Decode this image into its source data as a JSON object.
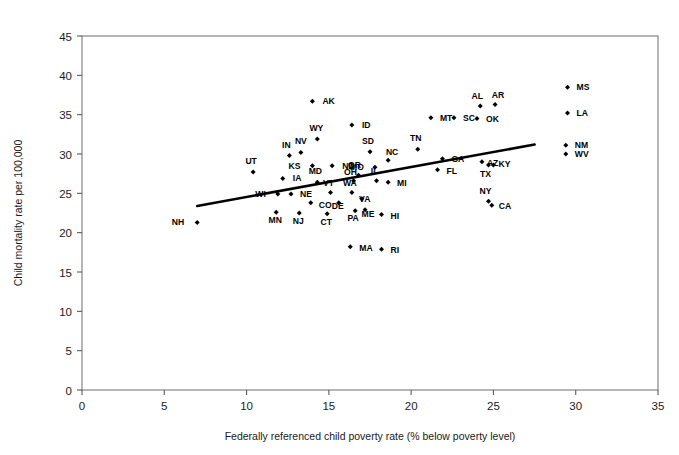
{
  "chart_data": {
    "type": "scatter",
    "title": "",
    "xlabel": "Federally referenced child poverty rate (% below poverty level)",
    "ylabel": "Child mortality rate per 100,000",
    "xlim": [
      0,
      35
    ],
    "ylim": [
      0,
      45
    ],
    "xticks": [
      0,
      5,
      10,
      15,
      20,
      25,
      30,
      35
    ],
    "yticks": [
      0,
      5,
      10,
      15,
      20,
      25,
      30,
      35,
      40,
      45
    ],
    "grid": false,
    "legend": null,
    "marker": "filled-diamond",
    "marker_color": "#000000",
    "trendline": {
      "type": "linear-fit",
      "color": "#000000",
      "x_start": 7.0,
      "y_start": 23.4,
      "x_end": 27.5,
      "y_end": 31.2
    },
    "point_label_field": "state",
    "points": [
      {
        "state": "NH",
        "x": 7.0,
        "y": 21.3,
        "lx": -13,
        "ly": 3
      },
      {
        "state": "UT",
        "x": 10.4,
        "y": 27.7,
        "lx": -2,
        "ly": -8
      },
      {
        "state": "MN",
        "x": 11.8,
        "y": 22.6,
        "lx": -1,
        "ly": 11
      },
      {
        "state": "IN",
        "x": 12.6,
        "y": 29.8,
        "lx": -3,
        "ly": -8
      },
      {
        "state": "NV",
        "x": 13.3,
        "y": 30.2,
        "lx": 0,
        "ly": -8
      },
      {
        "state": "IA",
        "x": 12.2,
        "y": 26.9,
        "lx": 10,
        "ly": 3
      },
      {
        "state": "WI",
        "x": 11.9,
        "y": 24.9,
        "lx": -12,
        "ly": 3
      },
      {
        "state": "NE",
        "x": 12.7,
        "y": 24.9,
        "lx": 9,
        "ly": 3
      },
      {
        "state": "KS",
        "x": 14.0,
        "y": 28.5,
        "lx": -12,
        "ly": 3
      },
      {
        "state": "ND",
        "x": 15.2,
        "y": 28.5,
        "lx": 10,
        "ly": 3
      },
      {
        "state": "WY",
        "x": 14.3,
        "y": 31.9,
        "lx": -1,
        "ly": -8
      },
      {
        "state": "AK",
        "x": 14.0,
        "y": 36.7,
        "lx": 10,
        "ly": 3
      },
      {
        "state": "ID",
        "x": 16.4,
        "y": 33.7,
        "lx": 10,
        "ly": 3
      },
      {
        "state": "MD",
        "x": 14.3,
        "y": 26.4,
        "lx": -2,
        "ly": -8
      },
      {
        "state": "CO",
        "x": 13.9,
        "y": 23.8,
        "lx": 8,
        "ly": 5
      },
      {
        "state": "NJ",
        "x": 13.2,
        "y": 22.5,
        "lx": -1,
        "ly": 11
      },
      {
        "state": "VT",
        "x": 15.1,
        "y": 25.1,
        "lx": -2,
        "ly": -7
      },
      {
        "state": "CT",
        "x": 14.9,
        "y": 22.4,
        "lx": -1,
        "ly": 11
      },
      {
        "state": "DE",
        "x": 15.6,
        "y": 23.8,
        "lx": -1,
        "ly": 6
      },
      {
        "state": "WA",
        "x": 16.4,
        "y": 25.1,
        "lx": -2,
        "ly": -7
      },
      {
        "state": "OH",
        "x": 16.5,
        "y": 26.6,
        "lx": -3,
        "ly": -6
      },
      {
        "state": "OR",
        "x": 16.8,
        "y": 27.3,
        "lx": -4,
        "ly": -7
      },
      {
        "state": "VA",
        "x": 17.0,
        "y": 24.3,
        "lx": 3,
        "ly": 3
      },
      {
        "state": "PA",
        "x": 16.6,
        "y": 22.8,
        "lx": -2,
        "ly": 10
      },
      {
        "state": "ME",
        "x": 17.2,
        "y": 22.9,
        "lx": 3,
        "ly": 7
      },
      {
        "state": "MA",
        "x": 16.3,
        "y": 18.2,
        "lx": 9,
        "ly": 4
      },
      {
        "state": "HI",
        "x": 18.2,
        "y": 22.3,
        "lx": 9,
        "ly": 4
      },
      {
        "state": "RI",
        "x": 18.2,
        "y": 17.9,
        "lx": 9,
        "ly": 4
      },
      {
        "state": "IL",
        "x": 17.9,
        "y": 26.6,
        "lx": -2,
        "ly": -7
      },
      {
        "state": "MI",
        "x": 18.6,
        "y": 26.4,
        "lx": 9,
        "ly": 4
      },
      {
        "state": "SD",
        "x": 17.5,
        "y": 30.3,
        "lx": -2,
        "ly": -8
      },
      {
        "state": "MO",
        "x": 17.8,
        "y": 28.3,
        "lx": -11,
        "ly": 3
      },
      {
        "state": "NC",
        "x": 18.6,
        "y": 29.2,
        "lx": 4,
        "ly": -5
      },
      {
        "state": "TN",
        "x": 20.4,
        "y": 30.6,
        "lx": -2,
        "ly": -8
      },
      {
        "state": "GA",
        "x": 21.9,
        "y": 29.4,
        "lx": 9,
        "ly": 3
      },
      {
        "state": "FL",
        "x": 21.6,
        "y": 28.0,
        "lx": 9,
        "ly": 4
      },
      {
        "state": "MT",
        "x": 21.2,
        "y": 34.6,
        "lx": 9,
        "ly": 3
      },
      {
        "state": "SC",
        "x": 22.6,
        "y": 34.6,
        "lx": 9,
        "ly": 3
      },
      {
        "state": "AZ",
        "x": 24.3,
        "y": 29.0,
        "lx": 5,
        "ly": 4
      },
      {
        "state": "OK",
        "x": 24.0,
        "y": 34.5,
        "lx": 9,
        "ly": 3
      },
      {
        "state": "AL",
        "x": 24.2,
        "y": 36.1,
        "lx": -3,
        "ly": -7
      },
      {
        "state": "AR",
        "x": 25.1,
        "y": 36.3,
        "lx": 3,
        "ly": -6
      },
      {
        "state": "KY",
        "x": 25.0,
        "y": 28.6,
        "lx": 5,
        "ly": 2
      },
      {
        "state": "TX",
        "x": 24.7,
        "y": 28.6,
        "lx": -3,
        "ly": 12
      },
      {
        "state": "NY",
        "x": 24.7,
        "y": 24.0,
        "lx": -3,
        "ly": -7
      },
      {
        "state": "CA",
        "x": 24.9,
        "y": 23.5,
        "lx": 7,
        "ly": 4
      },
      {
        "state": "MS",
        "x": 29.5,
        "y": 38.5,
        "lx": 9,
        "ly": 3
      },
      {
        "state": "LA",
        "x": 29.5,
        "y": 35.2,
        "lx": 9,
        "ly": 3
      },
      {
        "state": "NM",
        "x": 29.4,
        "y": 31.1,
        "lx": 9,
        "ly": 3
      },
      {
        "state": "WV",
        "x": 29.4,
        "y": 30.0,
        "lx": 9,
        "ly": 3
      }
    ]
  }
}
